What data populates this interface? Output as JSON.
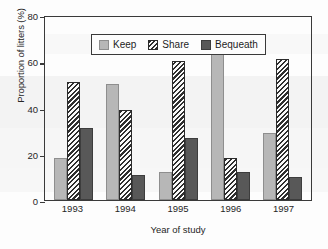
{
  "chart_data": {
    "type": "bar",
    "title": "",
    "xlabel": "Year of study",
    "ylabel": "Proportion of litters (%)",
    "categories": [
      "1993",
      "1994",
      "1995",
      "1996",
      "1997"
    ],
    "series": [
      {
        "name": "Keep",
        "values": [
          18,
          50,
          12,
          71,
          29
        ],
        "color": "#b7b7b7",
        "fill": "solid-light-gray"
      },
      {
        "name": "Share",
        "values": [
          51,
          39,
          60,
          18,
          61
        ],
        "color": "#2e2e2e",
        "fill": "diagonal-hatch"
      },
      {
        "name": "Bequeath",
        "values": [
          31,
          11,
          27,
          12,
          10
        ],
        "color": "#585858",
        "fill": "solid-dark-gray"
      }
    ],
    "ylim": [
      0,
      80
    ],
    "yticks": [
      0,
      20,
      40,
      60,
      80
    ],
    "ytick_labels": [
      "0",
      "20",
      "40",
      "60",
      "80"
    ],
    "grid": false,
    "legend_position": "top-left-inside",
    "bar_style": "grouped"
  },
  "axes": {
    "y_label": "Proportion of litters (%)",
    "x_label": "Year of study",
    "y_ticks": [
      {
        "value": 80,
        "label": "80"
      },
      {
        "value": 60,
        "label": "60"
      },
      {
        "value": 40,
        "label": "40"
      },
      {
        "value": 20,
        "label": "20"
      },
      {
        "value": 0,
        "label": "0"
      }
    ],
    "x_ticks": [
      {
        "label": "1993"
      },
      {
        "label": "1994"
      },
      {
        "label": "1995"
      },
      {
        "label": "1996"
      },
      {
        "label": "1997"
      }
    ]
  },
  "legend": {
    "entries": [
      {
        "label": "Keep",
        "swatch": "legend-swatch-keep"
      },
      {
        "label": "Share",
        "swatch": "legend-swatch-share"
      },
      {
        "label": "Bequeath",
        "swatch": "legend-swatch-bequeath"
      }
    ]
  },
  "colors": {
    "keep": "#b7b7b7",
    "share": "#2e2e2e",
    "bequeath": "#585858",
    "axis": "#3a3a3a",
    "text": "#262626",
    "background": "#fdfdfd"
  }
}
